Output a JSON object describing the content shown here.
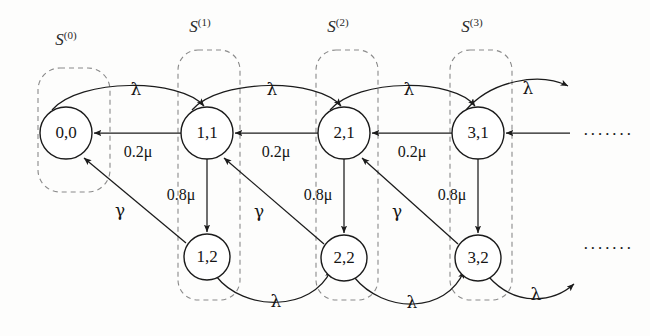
{
  "figure": {
    "type": "markov-state-transition-diagram",
    "background": "#fdfdfc",
    "stroke_color": "#1b1b1b",
    "dash_color": "#8a8a8a"
  },
  "set_labels": [
    {
      "base": "S",
      "sup": "(0)",
      "x": 66,
      "y": 45
    },
    {
      "base": "S",
      "sup": "(1)",
      "x": 200,
      "y": 32
    },
    {
      "base": "S",
      "sup": "(2)",
      "x": 338,
      "y": 32
    },
    {
      "base": "S",
      "sup": "(3)",
      "x": 472,
      "y": 32
    }
  ],
  "dashed_groups": [
    {
      "name": "S0-box",
      "x": 38,
      "y": 68,
      "w": 72,
      "h": 124,
      "rx": 22
    },
    {
      "name": "S1-box",
      "x": 178,
      "y": 50,
      "w": 62,
      "h": 250,
      "rx": 20
    },
    {
      "name": "S2-box",
      "x": 316,
      "y": 50,
      "w": 62,
      "h": 250,
      "rx": 20
    },
    {
      "name": "S3-box",
      "x": 450,
      "y": 50,
      "w": 62,
      "h": 250,
      "rx": 20
    }
  ],
  "nodes": [
    {
      "id": "n00",
      "label": "0,0",
      "x": 66,
      "y": 133,
      "r": 26
    },
    {
      "id": "n11",
      "label": "1,1",
      "x": 207,
      "y": 133,
      "r": 26
    },
    {
      "id": "n21",
      "label": "2,1",
      "x": 344,
      "y": 133,
      "r": 26
    },
    {
      "id": "n31",
      "label": "3,1",
      "x": 478,
      "y": 133,
      "r": 26
    },
    {
      "id": "n12",
      "label": "1,2",
      "x": 207,
      "y": 257,
      "r": 23
    },
    {
      "id": "n22",
      "label": "2,2",
      "x": 344,
      "y": 258,
      "r": 23
    },
    {
      "id": "n32",
      "label": "3,2",
      "x": 478,
      "y": 258,
      "r": 23
    }
  ],
  "edges": [
    {
      "name": "lambda-00-11",
      "rate": "λ",
      "from": "0,0",
      "to": "1,1",
      "kind": "arc-top",
      "d": "M 52 110 C 80 78, 180 78, 204 106",
      "lx": 136,
      "ly": 95
    },
    {
      "name": "lambda-11-21",
      "rate": "λ",
      "from": "1,1",
      "to": "2,1",
      "kind": "arc-top",
      "d": "M 192 110 C 220 78, 318 78, 341 106",
      "lx": 272,
      "ly": 95
    },
    {
      "name": "lambda-21-31",
      "rate": "λ",
      "from": "2,1",
      "to": "3,1",
      "kind": "arc-top",
      "d": "M 330 110 C 358 78, 454 78, 475 106",
      "lx": 409,
      "ly": 95
    },
    {
      "name": "lambda-31-next",
      "rate": "λ",
      "from": "3,1",
      "to": "beyond",
      "kind": "arc-top-open",
      "d": "M 466 110 C 492 80, 540 72, 568 86",
      "lx": 528,
      "ly": 94
    },
    {
      "name": "mu-low-11-00",
      "rate": "0.2μ",
      "from": "1,1",
      "to": "0,0",
      "kind": "straight-left",
      "d": "M 181 133 L 94 133",
      "lx": 138,
      "ly": 157
    },
    {
      "name": "mu-low-21-11",
      "rate": "0.2μ",
      "from": "2,1",
      "to": "1,1",
      "kind": "straight-left",
      "d": "M 318 133 L 235 133",
      "lx": 276,
      "ly": 157
    },
    {
      "name": "mu-low-31-21",
      "rate": "0.2μ",
      "from": "3,1",
      "to": "2,1",
      "kind": "straight-left",
      "d": "M 452 133 L 372 133",
      "lx": 412,
      "ly": 157
    },
    {
      "name": "mu-low-next-31",
      "rate": "",
      "from": "beyond",
      "to": "3,1",
      "kind": "straight-left",
      "d": "M 570 133 L 506 133",
      "lx": 0,
      "ly": 0
    },
    {
      "name": "mu-high-11-12",
      "rate": "0.8μ",
      "from": "1,1",
      "to": "1,2",
      "kind": "vertical-down",
      "d": "M 207 159 L 207 232",
      "lx": 181,
      "ly": 200
    },
    {
      "name": "mu-high-21-22",
      "rate": "0.8μ",
      "from": "2,1",
      "to": "2,2",
      "kind": "vertical-down",
      "d": "M 344 159 L 344 233",
      "lx": 318,
      "ly": 200
    },
    {
      "name": "mu-high-31-32",
      "rate": "0.8μ",
      "from": "3,1",
      "to": "3,2",
      "kind": "vertical-down",
      "d": "M 478 159 L 478 233",
      "lx": 452,
      "ly": 200
    },
    {
      "name": "gamma-12-00",
      "rate": "γ",
      "from": "1,2",
      "to": "0,0",
      "kind": "diagonal-up-left",
      "d": "M 186 243 L 84 158",
      "lx": 120,
      "ly": 216
    },
    {
      "name": "gamma-22-11",
      "rate": "γ",
      "from": "2,2",
      "to": "1,1",
      "kind": "diagonal-up-left",
      "d": "M 324 244 L 224 158",
      "lx": 259,
      "ly": 217
    },
    {
      "name": "gamma-32-21",
      "rate": "γ",
      "from": "3,2",
      "to": "2,1",
      "kind": "diagonal-up-left",
      "d": "M 458 244 L 362 158",
      "lx": 397,
      "ly": 217
    },
    {
      "name": "lambda-12-22",
      "rate": "λ",
      "from": "1,2",
      "to": "2,2",
      "kind": "arc-bottom",
      "d": "M 216 276 C 244 312, 312 312, 331 270",
      "lx": 276,
      "ly": 307
    },
    {
      "name": "lambda-22-32",
      "rate": "λ",
      "from": "2,2",
      "to": "3,2",
      "kind": "arc-bottom",
      "d": "M 354 277 C 384 314, 446 314, 464 271",
      "lx": 412,
      "ly": 308
    },
    {
      "name": "lambda-32-next",
      "rate": "λ",
      "from": "3,2",
      "to": "beyond",
      "kind": "arc-bottom-open",
      "d": "M 488 276 C 516 308, 554 302, 574 284",
      "lx": 536,
      "ly": 300
    }
  ],
  "continuations": [
    {
      "name": "ellipsis-top",
      "text": "·······",
      "x": 608,
      "y": 140
    },
    {
      "name": "ellipsis-bottom",
      "text": "·······",
      "x": 608,
      "y": 254
    }
  ]
}
